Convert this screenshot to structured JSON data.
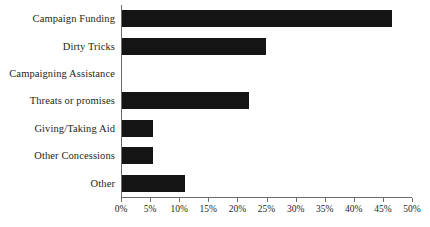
{
  "chart_data": {
    "type": "bar",
    "orientation": "horizontal",
    "title": "",
    "xlabel": "",
    "ylabel": "",
    "categories": [
      "Campaign Funding",
      "Dirty Tricks",
      "Campaigning Assistance",
      "Threats or promises",
      "Giving/Taking Aid",
      "Other Concessions",
      "Other"
    ],
    "values": [
      46.4,
      24.7,
      0,
      21.8,
      5.3,
      5.3,
      10.8
    ],
    "value_suffix": "%",
    "xlim": [
      0,
      50
    ],
    "tick_labels": [
      "0%",
      "5%",
      "10%",
      "15%",
      "20%",
      "25%",
      "30%",
      "35%",
      "40%",
      "45%",
      "50%"
    ],
    "tick_values": [
      0,
      5,
      10,
      15,
      20,
      25,
      30,
      35,
      40,
      45,
      50
    ],
    "grid": false,
    "legend": false,
    "bar_color": "#141414",
    "axis_color": "#6b6b6b",
    "text_color": "#231f20",
    "background": "#ffffff"
  }
}
